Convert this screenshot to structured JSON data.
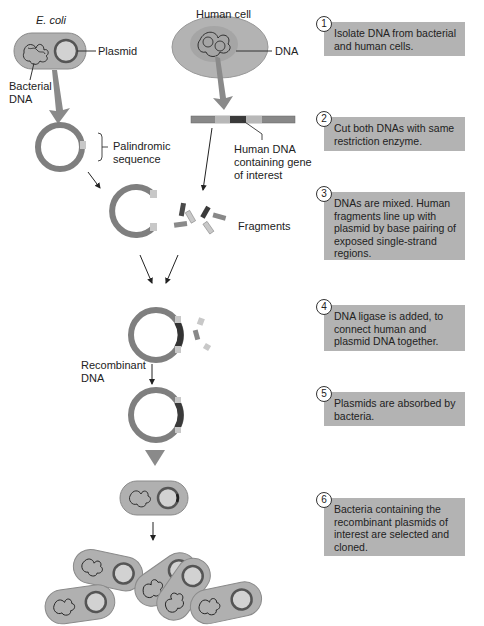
{
  "figure": {
    "labels": {
      "ecoli": "E. coli",
      "plasmid": "Plasmid",
      "bacterial_dna_line1": "Bacterial",
      "bacterial_dna_line2": "DNA",
      "human_cell": "Human cell",
      "dna": "DNA",
      "palindromic_line1": "Palindromic",
      "palindromic_line2": "sequence",
      "human_dna_line1": "Human DNA",
      "human_dna_line2": "containing gene",
      "human_dna_line3": "of interest",
      "fragments": "Fragments",
      "recombinant_line1": "Recombinant",
      "recombinant_line2": "DNA"
    },
    "steps": [
      {
        "number": "1",
        "text": "Isolate DNA from bacterial and human cells."
      },
      {
        "number": "2",
        "text": "Cut both DNAs with same restriction enzyme."
      },
      {
        "number": "3",
        "text": "DNAs are mixed. Human fragments line up with plasmid by base pairing of exposed single-strand regions."
      },
      {
        "number": "4",
        "text": "DNA ligase is added, to connect human and plasmid DNA together."
      },
      {
        "number": "5",
        "text": "Plasmids are absorbed by bacteria."
      },
      {
        "number": "6",
        "text": "Bacteria containing the recombinant plasmids of interest are selected and cloned."
      }
    ],
    "colors": {
      "step_box": "#b3b3b3",
      "plasmid_ring": "#7f7f7f",
      "cell_fill": "#b0b0b0",
      "human_dna_dark": "#3a3a3a",
      "sticky_end_light": "#c8c8c8"
    }
  }
}
